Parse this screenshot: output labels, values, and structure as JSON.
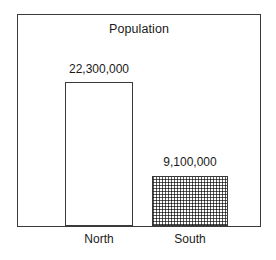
{
  "chart_data": {
    "type": "bar",
    "title": "Population",
    "xlabel": "",
    "ylabel": "",
    "categories": [
      "North",
      "South"
    ],
    "values": [
      22300000,
      9100000
    ],
    "value_labels": [
      "22,300,000",
      "9,100,000"
    ],
    "series": [
      {
        "name": "Population",
        "values": [
          22300000,
          9100000
        ]
      }
    ],
    "grid": false,
    "legend": "none",
    "axis_visible": {
      "x_baseline": true,
      "y_axis": false,
      "tick_labels": false
    },
    "bar_styles": [
      {
        "category": "North",
        "fill": "none",
        "outline": "#3a3a3a"
      },
      {
        "category": "South",
        "fill": "stipple-dotted",
        "outline": "#3a3a3a"
      }
    ]
  },
  "colors": {
    "frame": "#3a3a3a",
    "outline": "#3a3a3a",
    "stipple": "#5a5a5a",
    "background": "#ffffff",
    "text": "#1a1a1a"
  }
}
